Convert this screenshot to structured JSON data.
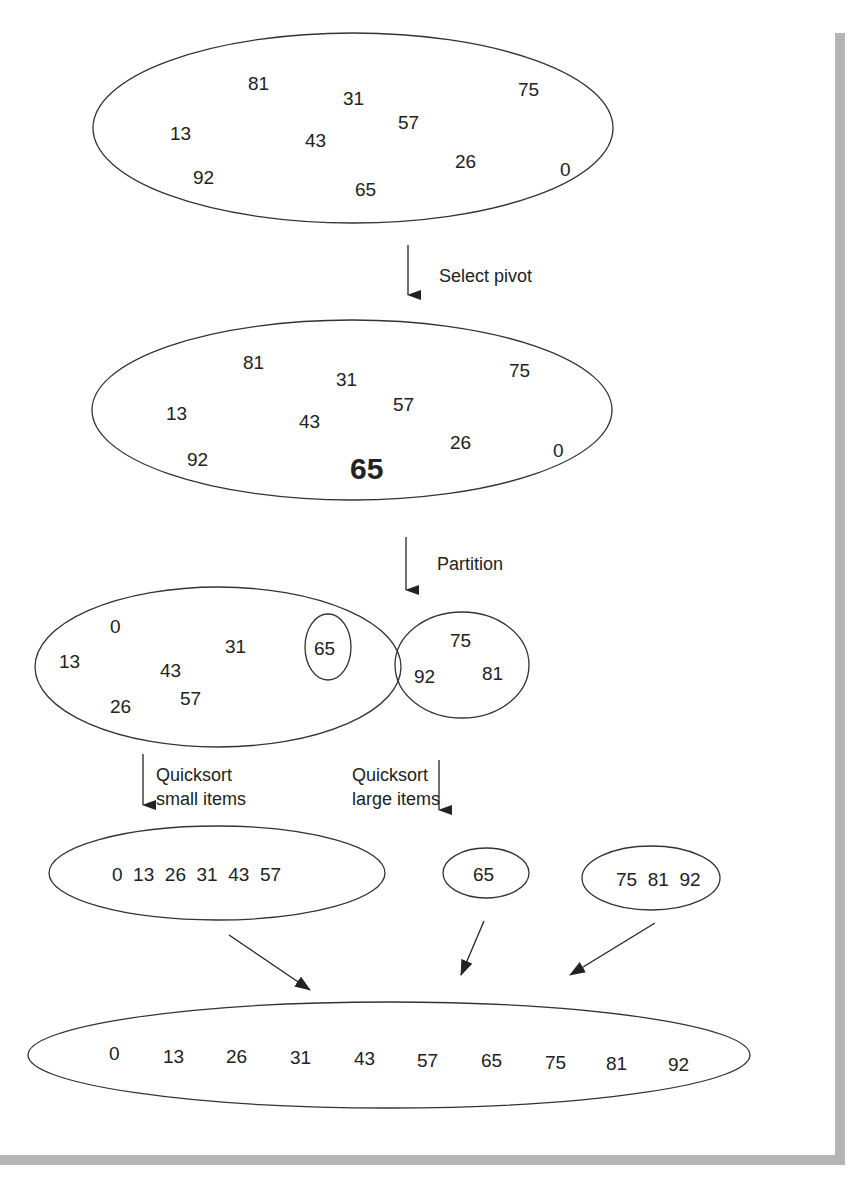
{
  "figure": {
    "steps": {
      "select_pivot": "Select pivot",
      "partition": "Partition",
      "quicksort_small_line1": "Quicksort",
      "quicksort_small_line2": "small items",
      "quicksort_large_line1": "Quicksort",
      "quicksort_large_line2": "large items"
    },
    "initial_set": [
      "81",
      "31",
      "75",
      "13",
      "43",
      "57",
      "26",
      "0",
      "92",
      "65"
    ],
    "pivot_set": {
      "items": [
        "81",
        "31",
        "75",
        "13",
        "43",
        "57",
        "26",
        "0",
        "92"
      ],
      "pivot": "65"
    },
    "partition": {
      "small": [
        "0",
        "31",
        "13",
        "43",
        "26",
        "57"
      ],
      "pivot": "65",
      "large": [
        "75",
        "92",
        "81"
      ]
    },
    "sorted_parts": {
      "small": "0  13  26  31  43  57",
      "pivot": "65",
      "large": "75  81  92"
    },
    "final_sorted": [
      "0",
      "13",
      "26",
      "31",
      "43",
      "57",
      "65",
      "75",
      "81",
      "92"
    ]
  }
}
